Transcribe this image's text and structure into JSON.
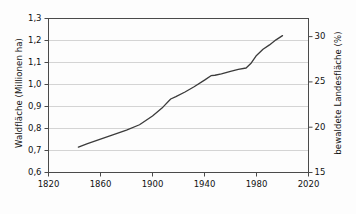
{
  "chart_data": {
    "type": "line",
    "title": "",
    "subtitle": "",
    "xlabel": "",
    "ylabel": "Waldfläche (Millionen ha)",
    "y2label": "bewaldete Landesfläche (%)",
    "xlim": [
      1820,
      2020
    ],
    "ylim": [
      0.6,
      1.3
    ],
    "y2lim": [
      15.0,
      32.0
    ],
    "grid": true,
    "legend": null,
    "x_ticks": [
      1820,
      1860,
      1900,
      1940,
      1980,
      2020
    ],
    "x_tick_labels": [
      "1820",
      "1860",
      "1900",
      "1940",
      "1980",
      "2020"
    ],
    "y_ticks": [
      0.6,
      0.7,
      0.8,
      0.9,
      1.0,
      1.1,
      1.2,
      1.3
    ],
    "y_tick_labels": [
      "0,6",
      "0,7",
      "0,8",
      "0,9",
      "1,0",
      "1,1",
      "1,2",
      "1,3"
    ],
    "y2_ticks": [
      15,
      20,
      25,
      30
    ],
    "y2_tick_labels": [
      "15",
      "20",
      "25",
      "30"
    ],
    "line_color": "#3b3b3b",
    "grid_color": "#c9c9c9",
    "axis_color": "#4a4a4a",
    "series": [
      {
        "name": "Waldfläche",
        "x": [
          1843,
          1850,
          1860,
          1870,
          1880,
          1890,
          1900,
          1908,
          1914,
          1918,
          1925,
          1932,
          1940,
          1945,
          1948,
          1953,
          1960,
          1966,
          1972,
          1976,
          1980,
          1985,
          1990,
          1995,
          2000
        ],
        "values": [
          0.715,
          0.731,
          0.752,
          0.772,
          0.793,
          0.817,
          0.857,
          0.897,
          0.934,
          0.945,
          0.966,
          0.99,
          1.02,
          1.04,
          1.042,
          1.048,
          1.06,
          1.069,
          1.075,
          1.098,
          1.132,
          1.16,
          1.18,
          1.203,
          1.222
        ]
      }
    ]
  },
  "axes": {
    "left_title": "Waldfläche (Millionen ha)",
    "right_title": "bewaldete Landesfläche (%)"
  }
}
